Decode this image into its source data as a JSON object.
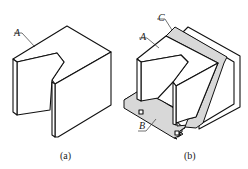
{
  "figure": {
    "panels": [
      {
        "id": "a",
        "caption": "(a)",
        "labels": [
          {
            "text": "A",
            "target": "top face of notched block"
          }
        ]
      },
      {
        "id": "b",
        "caption": "(b)",
        "labels": [
          {
            "text": "A",
            "target": "top face of notched block"
          },
          {
            "text": "C",
            "target": "inclined cutting plane (shaded)"
          },
          {
            "text": "B",
            "target": "horizontal base plane (shaded)"
          }
        ]
      }
    ],
    "colors": {
      "line": "#111111",
      "shade": "#d8d8d8",
      "background": "#ffffff"
    }
  }
}
